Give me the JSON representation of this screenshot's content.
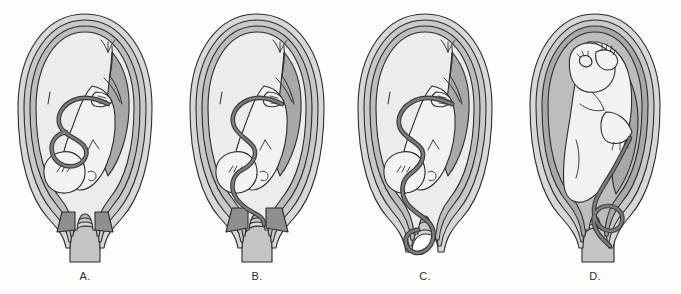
{
  "figure": {
    "background_color": "#fdfdfc",
    "width": 681,
    "height": 294,
    "style": "grayscale medical line illustration"
  },
  "palette": {
    "outline": "#2b2b2b",
    "myometrium_outer": "#d8d8d6",
    "myometrium_mid": "#c9c9c7",
    "decidua": "#bdbdbb",
    "amniotic_fluid": "#ececea",
    "fetus_fill": "#f2f2f0",
    "placenta": "#a8a8a6",
    "cervix_dark": "#8f8f8d",
    "cord": "#7d7d7b",
    "cord_outline": "#3a3a3a",
    "vagina": "#c4c4c2"
  },
  "panels": [
    {
      "id": "A",
      "label": "A.",
      "label_letter": "A",
      "presentation": "cephalic vertex",
      "cord_position": "cord loops contained within uterine cavity above the presenting part",
      "cervix_state": "closed",
      "cord_visible_below_cervix": "no",
      "icon": "uterus-fetus-cord-normal-icon"
    },
    {
      "id": "B",
      "label": "B.",
      "label_letter": "B",
      "presentation": "cephalic vertex",
      "cord_position": "cord descended alongside the head to the level of the internal cervical os (occult prolapse)",
      "cervix_state": "partially open",
      "cord_visible_below_cervix": "no",
      "icon": "uterus-fetus-cord-occult-icon"
    },
    {
      "id": "C",
      "label": "C.",
      "label_letter": "C",
      "presentation": "cephalic vertex",
      "cord_position": "cord has passed through the cervix into the vagina (overt prolapse)",
      "cervix_state": "open",
      "cord_visible_below_cervix": "yes",
      "icon": "uterus-fetus-cord-overt-prolapse-icon"
    },
    {
      "id": "D",
      "label": "D.",
      "label_letter": "D",
      "presentation": "breech / non-vertex lie",
      "cord_position": "cord looped beside the presenting part in the lower uterine segment",
      "cervix_state": "open",
      "cord_visible_below_cervix": "partial",
      "icon": "uterus-fetus-breech-cord-icon"
    }
  ]
}
